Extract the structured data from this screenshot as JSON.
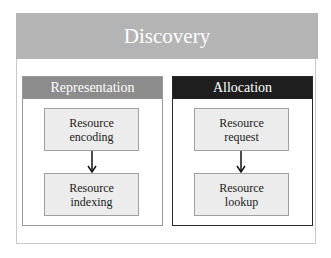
{
  "diagram": {
    "title": "Discovery",
    "colors": {
      "title_band": "#b4b4b4",
      "representation_header": "#8c8c8c",
      "allocation_header": "#1e1e1e",
      "node_fill": "#ececec"
    },
    "panels": [
      {
        "label": "Representation",
        "nodes": [
          {
            "line1": "Resource",
            "line2": "encoding"
          },
          {
            "line1": "Resource",
            "line2": "indexing"
          }
        ]
      },
      {
        "label": "Allocation",
        "nodes": [
          {
            "line1": "Resource",
            "line2": "request"
          },
          {
            "line1": "Resource",
            "line2": "lookup"
          }
        ]
      }
    ],
    "edges": [
      {
        "from": "Resource encoding",
        "to": "Resource indexing"
      },
      {
        "from": "Resource request",
        "to": "Resource lookup"
      }
    ]
  }
}
